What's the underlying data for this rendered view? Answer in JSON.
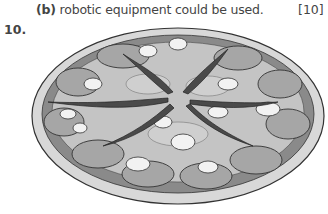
{
  "question_part": {
    "label": "(b)",
    "text": "robotic equipment could be used.",
    "marks": "[10]"
  },
  "question": {
    "number": "10."
  },
  "figure": {
    "colors": {
      "crust": "#d8d8d8",
      "sauce_rim": "#8a8a8a",
      "cheese": "#c4c4c4",
      "tomato": "#a6a6a6",
      "pepper": "#4a4a4a",
      "mushroom": "#f2f2f2",
      "outline": "#333333"
    }
  }
}
